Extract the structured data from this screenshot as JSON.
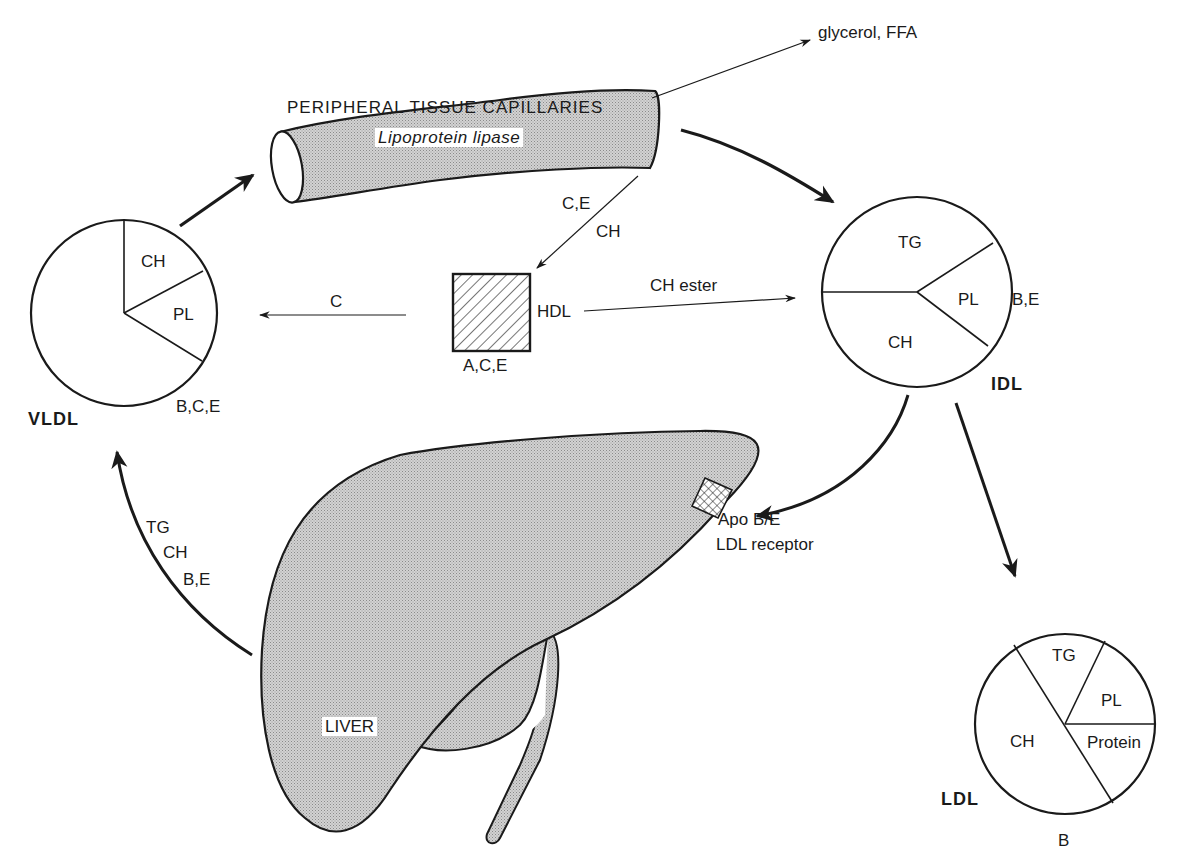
{
  "colors": {
    "ink": "#1a1a1a",
    "shade": "#c4c4c4",
    "background": "#ffffff"
  },
  "capillary": {
    "title": "PERIPHERAL TISSUE CAPILLARIES",
    "enzyme": "Lipoprotein lipase"
  },
  "products": {
    "label": "glycerol, FFA"
  },
  "vldl": {
    "name": "VLDL",
    "apoproteins": "B,C,E",
    "segments": [
      "CH",
      "PL"
    ]
  },
  "idl": {
    "name": "IDL",
    "apoproteins": "B,E",
    "segments": [
      "TG",
      "PL",
      "CH"
    ]
  },
  "ldl": {
    "name": "LDL",
    "apoproteins": "B",
    "segments": [
      "TG",
      "PL",
      "CH",
      "Protein"
    ]
  },
  "hdl": {
    "name": "HDL",
    "apoproteins": "A,C,E"
  },
  "transfers": {
    "capillary_to_hdl": [
      "C,E",
      "CH"
    ],
    "hdl_to_vldl": "C",
    "hdl_to_idl": "CH ester",
    "liver_to_vldl": [
      "TG",
      "CH",
      "B,E"
    ]
  },
  "liver": {
    "name": "LIVER",
    "receptor": [
      "Apo B/E",
      "LDL receptor"
    ]
  }
}
